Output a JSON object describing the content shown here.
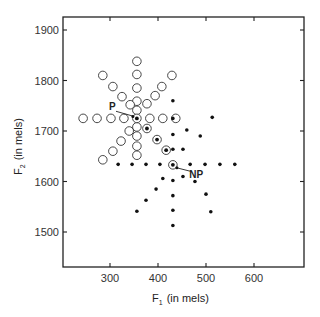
{
  "chart_data": {
    "type": "scatter",
    "title": "",
    "xlabel": "F1 (in mels)",
    "xlabel_main": "F",
    "xlabel_sub": "1",
    "xlabel_unit": "(in mels)",
    "ylabel": "F2 (in mels)",
    "ylabel_main": "F",
    "ylabel_sub": "2",
    "ylabel_unit": "(in mels)",
    "xlim": [
      205,
      700
    ],
    "ylim": [
      1425,
      1925
    ],
    "xticks": [
      300,
      400,
      500,
      600
    ],
    "yticks": [
      1500,
      1600,
      1700,
      1800,
      1900
    ],
    "grid": false,
    "legend": null,
    "annotations": [
      {
        "label": "P",
        "target": [
          356,
          1725
        ],
        "text_at": [
          300,
          1743
        ]
      },
      {
        "label": "NP",
        "target": [
          431,
          1633
        ],
        "text_at": [
          465,
          1606
        ]
      }
    ],
    "series": [
      {
        "name": "open circles (prototype-centered set)",
        "marker": "open-circle",
        "points": [
          [
            244,
            1725
          ],
          [
            273,
            1725
          ],
          [
            302,
            1725
          ],
          [
            329,
            1725
          ],
          [
            383,
            1725
          ],
          [
            410,
            1725
          ],
          [
            437,
            1725
          ],
          [
            356,
            1838
          ],
          [
            356,
            1812
          ],
          [
            356,
            1785
          ],
          [
            356,
            1759
          ],
          [
            356,
            1741
          ],
          [
            356,
            1708
          ],
          [
            356,
            1690
          ],
          [
            356,
            1670
          ],
          [
            356,
            1652
          ],
          [
            285,
            1810
          ],
          [
            306,
            1788
          ],
          [
            325,
            1768
          ],
          [
            342,
            1752
          ],
          [
            429,
            1810
          ],
          [
            408,
            1788
          ],
          [
            394,
            1770
          ],
          [
            377,
            1754
          ],
          [
            340,
            1700
          ],
          [
            323,
            1680
          ],
          [
            306,
            1660
          ],
          [
            285,
            1643
          ]
        ]
      },
      {
        "name": "filled dots (nonprototype-centered set)",
        "marker": "filled-dot",
        "points": [
          [
            317,
            1634
          ],
          [
            346,
            1634
          ],
          [
            375,
            1634
          ],
          [
            404,
            1634
          ],
          [
            467,
            1634
          ],
          [
            498,
            1634
          ],
          [
            529,
            1634
          ],
          [
            560,
            1634
          ],
          [
            431,
            1760
          ],
          [
            431,
            1725
          ],
          [
            431,
            1693
          ],
          [
            431,
            1664
          ],
          [
            431,
            1602
          ],
          [
            431,
            1572
          ],
          [
            431,
            1543
          ],
          [
            431,
            1513
          ],
          [
            460,
            1702
          ],
          [
            488,
            1690
          ],
          [
            513,
            1727
          ],
          [
            452,
            1664
          ],
          [
            477,
            1600
          ],
          [
            500,
            1575
          ],
          [
            510,
            1540
          ],
          [
            410,
            1606
          ],
          [
            396,
            1585
          ],
          [
            375,
            1563
          ],
          [
            356,
            1541
          ],
          [
            452,
            1610
          ]
        ]
      },
      {
        "name": "ringed dots",
        "marker": "circled-dot",
        "points": [
          [
            356,
            1725
          ],
          [
            377,
            1705
          ],
          [
            398,
            1683
          ],
          [
            417,
            1662
          ],
          [
            431,
            1633
          ]
        ]
      }
    ]
  }
}
